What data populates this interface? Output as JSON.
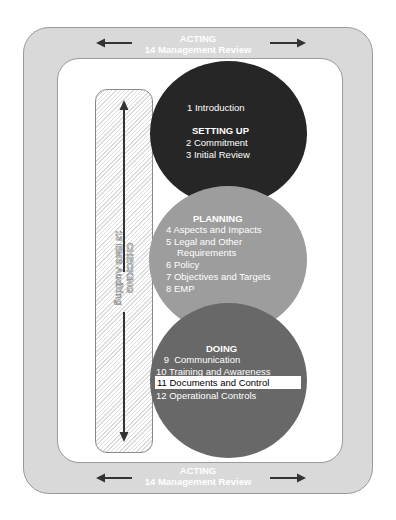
{
  "acting_top": {
    "title": "ACTING",
    "subtitle": "14  Management Review"
  },
  "acting_bottom": {
    "title": "ACTING",
    "subtitle": "14  Management Review"
  },
  "checking": {
    "title": "CHECKING",
    "subtitle": "13  EMS Auditing"
  },
  "setting_up": {
    "intro": "1  Introduction",
    "title": "SETTING UP",
    "items": [
      "2  Commitment",
      "3  Initial Review"
    ]
  },
  "planning": {
    "title": "PLANNING",
    "items": [
      "4  Aspects and Impacts",
      "5  Legal and Other",
      "    Requirements",
      "6  Policy",
      "7  Objectives and Targets",
      "8  EMP"
    ]
  },
  "doing": {
    "title": "DOING",
    "items": [
      " 9  Communication",
      "10  Training and Awareness",
      "11  Documents and Control",
      "12  Operational Controls"
    ],
    "highlighted_index": 2
  },
  "colors": {
    "frame": "#d9d9d9",
    "setting_up_circle": "#262626",
    "planning_circle": "#9d9d9d",
    "doing_circle": "#686868",
    "arrow": "#333333"
  }
}
